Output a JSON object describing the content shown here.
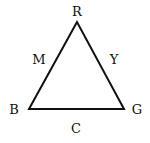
{
  "diagram": {
    "type": "color-triangle",
    "vertices": [
      {
        "label": "R",
        "x": 77,
        "y": 22
      },
      {
        "label": "B",
        "x": 29,
        "y": 109
      },
      {
        "label": "G",
        "x": 124,
        "y": 109
      }
    ],
    "edge_labels": [
      {
        "label": "M",
        "between": [
          "R",
          "B"
        ]
      },
      {
        "label": "Y",
        "between": [
          "R",
          "G"
        ]
      },
      {
        "label": "C",
        "between": [
          "B",
          "G"
        ]
      }
    ],
    "stroke_color": "#111111"
  }
}
